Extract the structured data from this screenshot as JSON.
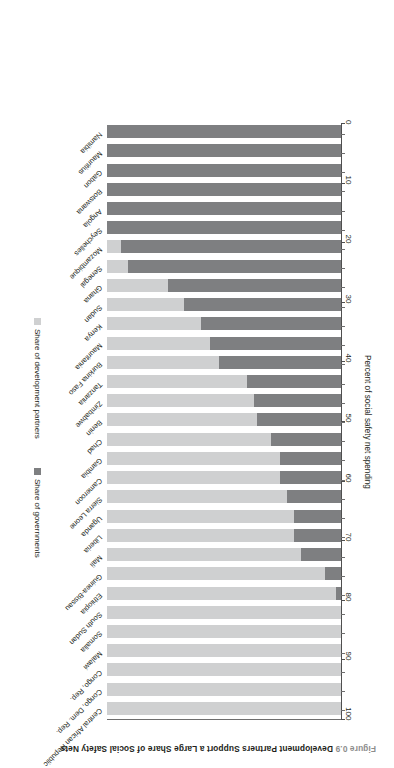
{
  "figure": {
    "number": "Figure 0.9",
    "title": "Development Partners Support a Large Share of Social Safety Nets"
  },
  "legend": {
    "position": "bottom",
    "entries": [
      {
        "label": "Share of development partners",
        "color": "#cfd0d1",
        "key": "development_partners"
      },
      {
        "label": "Share of governments",
        "color": "#7e7f81",
        "key": "governments"
      }
    ]
  },
  "axis": {
    "value_axis_title": "Percent of social safety net spending",
    "ticks": [
      "0",
      "10",
      "20",
      "30",
      "40",
      "50",
      "60",
      "70",
      "80",
      "90",
      "100"
    ],
    "min": 0,
    "max": 100,
    "category_axis_title": ""
  },
  "chart_data": {
    "type": "bar",
    "orientation": "horizontal-stacked",
    "title": "Development Partners Support a Large Share of Social Safety Nets",
    "subtitle": "Figure 0.9",
    "xlabel": "",
    "ylabel": "Percent of social safety net spending",
    "ylim": [
      0,
      100
    ],
    "grid": false,
    "stacked": true,
    "legend_position": "bottom",
    "categories": [
      "Central African Republic",
      "Congo, Dem. Rep.",
      "Congo, Rep.",
      "Malawi",
      "Somalia",
      "South Sudan",
      "Ethiopia",
      "Guinea-Bissau",
      "Mali",
      "Liberia",
      "Uganda",
      "Sierra Leone",
      "Cameroon",
      "Gambia",
      "Chad",
      "Benin",
      "Zimbabwe",
      "Tanzania",
      "Burkina Faso",
      "Mauritania",
      "Kenya",
      "Sudan",
      "Ghana",
      "Senegal",
      "Mozambique",
      "Seychelles",
      "Angola",
      "Botswana",
      "Gabon",
      "Mauritius",
      "Namibia"
    ],
    "series": [
      {
        "name": "Share of governments",
        "color": "#7e7f81",
        "values": [
          0,
          0,
          0,
          0,
          0,
          0,
          2,
          7,
          17,
          20,
          20,
          23,
          26,
          26,
          30,
          36,
          37,
          40,
          52,
          56,
          60,
          67,
          74,
          91,
          94,
          100,
          100,
          100,
          100,
          100,
          100
        ]
      },
      {
        "name": "Share of development partners",
        "color": "#cfd0d1",
        "values": [
          100,
          100,
          100,
          100,
          100,
          100,
          98,
          93,
          83,
          80,
          80,
          77,
          74,
          74,
          70,
          64,
          63,
          60,
          48,
          44,
          40,
          33,
          26,
          9,
          6,
          0,
          0,
          0,
          0,
          0,
          0
        ]
      }
    ]
  }
}
